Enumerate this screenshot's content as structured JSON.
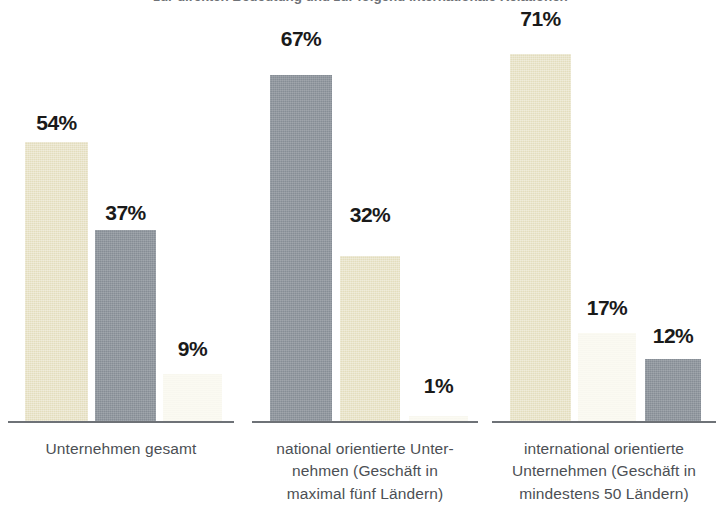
{
  "headline": {
    "text": "zur direkten Bedeutung und zur folgend internationale Relationen"
  },
  "chart_data": {
    "type": "bar",
    "title": "",
    "subtitle": "",
    "xlabel": "",
    "ylabel": "",
    "ylim": [
      0,
      75
    ],
    "grid": false,
    "legend_position": "none",
    "value_suffix": "%",
    "categories": [
      "Unternehmen gesamt",
      "national orientierte Unter-\nnehmen (Geschäft in\nmaximal fünf Ländern)",
      "international orientierte\nUnternehmen (Geschäft in\nmindestens 50 Ländern)"
    ],
    "series": [
      {
        "name": "tan",
        "color": "#e3ddbd",
        "values": [
          54,
          32,
          71
        ]
      },
      {
        "name": "gray",
        "color": "#868d95",
        "values": [
          37,
          67,
          12
        ]
      },
      {
        "name": "cream",
        "color": "#fbfaf2",
        "values": [
          9,
          1,
          17
        ]
      }
    ],
    "groups": [
      {
        "category_lines": [
          "Unternehmen gesamt"
        ],
        "bars": [
          {
            "label": "54%",
            "value": 54,
            "style": "tan"
          },
          {
            "label": "37%",
            "value": 37,
            "style": "gray"
          },
          {
            "label": "9%",
            "value": 9,
            "style": "cream"
          }
        ]
      },
      {
        "category_lines": [
          "national orientierte Unter-",
          "nehmen (Geschäft in",
          "maximal fünf Ländern)"
        ],
        "bars": [
          {
            "label": "67%",
            "value": 67,
            "style": "gray"
          },
          {
            "label": "32%",
            "value": 32,
            "style": "tan"
          },
          {
            "label": "1%",
            "value": 1,
            "style": "cream"
          }
        ]
      },
      {
        "category_lines": [
          "international orientierte",
          "Unternehmen (Geschäft in",
          "mindestens 50 Ländern)"
        ],
        "bars": [
          {
            "label": "71%",
            "value": 71,
            "style": "tan"
          },
          {
            "label": "17%",
            "value": 17,
            "style": "cream"
          },
          {
            "label": "12%",
            "value": 12,
            "style": "gray"
          }
        ]
      }
    ],
    "colors": {
      "tan": "#e3ddbd",
      "gray": "#868d95",
      "cream": "#fbfaf2",
      "baseline": "#6e7277",
      "value_text": "#1a1a1a",
      "category_text": "#4c4f54",
      "background": "#ffffff"
    }
  },
  "groups_layout": [
    {
      "baseline": {
        "left": 8,
        "width": 226
      },
      "label": {
        "left": 4,
        "top": 438,
        "width": 234
      },
      "bars": [
        {
          "left": 25,
          "width": 63,
          "label_top": 112
        },
        {
          "left": 95,
          "width": 61,
          "label_top": 202
        },
        {
          "left": 163,
          "width": 59,
          "label_top": 338
        }
      ]
    },
    {
      "baseline": {
        "left": 252,
        "width": 226
      },
      "label": {
        "left": 248,
        "top": 438,
        "width": 234
      },
      "bars": [
        {
          "left": 270,
          "width": 62,
          "label_top": 28
        },
        {
          "left": 340,
          "width": 60,
          "label_top": 204
        },
        {
          "left": 409,
          "width": 59,
          "label_top": 375
        }
      ]
    },
    {
      "baseline": {
        "left": 492,
        "width": 224
      },
      "label": {
        "left": 488,
        "top": 438,
        "width": 232
      },
      "bars": [
        {
          "left": 510,
          "width": 61,
          "label_top": 8
        },
        {
          "left": 578,
          "width": 58,
          "label_top": 297
        },
        {
          "left": 645,
          "width": 56,
          "label_top": 325
        }
      ]
    }
  ]
}
